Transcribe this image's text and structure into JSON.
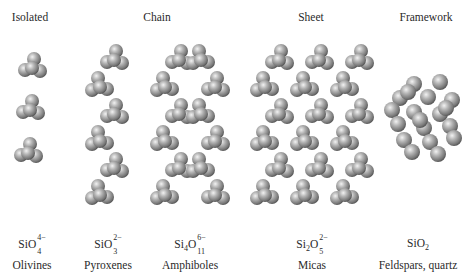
{
  "categories": [
    {
      "title": "Isolated",
      "x": 30
    },
    {
      "title": "Chain",
      "x": 157
    },
    {
      "title": "Sheet",
      "x": 311
    },
    {
      "title": "Framework",
      "x": 426
    }
  ],
  "columns": [
    {
      "id": "olivines",
      "x": 32,
      "formula": {
        "parts": [
          {
            "t": "SiO"
          }
        ],
        "sup": "4−",
        "sub": "4"
      },
      "mineral": "Olivines"
    },
    {
      "id": "pyroxenes",
      "x": 108,
      "formula": {
        "parts": [
          {
            "t": "SiO"
          }
        ],
        "sup": "2−",
        "sub": "3"
      },
      "mineral": "Pyroxenes"
    },
    {
      "id": "amphiboles",
      "x": 190,
      "formula": {
        "parts": [
          {
            "t": "Si"
          },
          {
            "sub": "4"
          },
          {
            "t": "O"
          }
        ],
        "sup": "6−",
        "sub": "11"
      },
      "mineral": "Amphiboles"
    },
    {
      "id": "micas",
      "x": 312,
      "formula": {
        "parts": [
          {
            "t": "Si"
          },
          {
            "sub": "2"
          },
          {
            "t": "O"
          }
        ],
        "sup": "2−",
        "sub": "5"
      },
      "mineral": "Micas"
    },
    {
      "id": "framework",
      "x": 418,
      "formula": {
        "parts": [
          {
            "t": "SiO"
          },
          {
            "sub": "2"
          }
        ]
      },
      "mineral": "Feldspars, quartz"
    }
  ],
  "colors": {
    "sphere_light": "#e6e6e6",
    "sphere_mid": "#9a9a9a",
    "sphere_dark": "#555555",
    "text": "#2a2a2a"
  }
}
